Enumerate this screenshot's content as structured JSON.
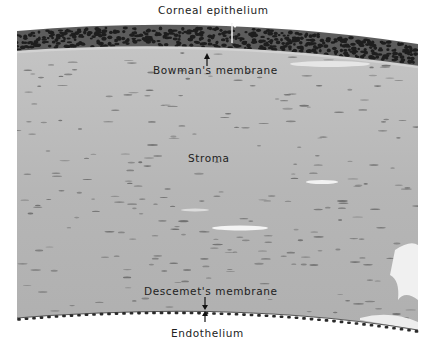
{
  "figure": {
    "labels": {
      "corneal_epithelium": "Corneal epithelium",
      "bowmans_membrane": "Bowman's membrane",
      "stroma": "Stroma",
      "descemets_membrane": "Descemet's membrane",
      "endothelium": "Endothelium"
    },
    "colors": {
      "background": "#ffffff",
      "epithelium": "#5a5a5a",
      "epithelium_nuclei": "#1e1e1e",
      "stroma": "#b9b9b9",
      "stroma_nuclei": "#6a6a6a",
      "endothelium": "#2a2a2a",
      "label_text": "#222222"
    }
  }
}
